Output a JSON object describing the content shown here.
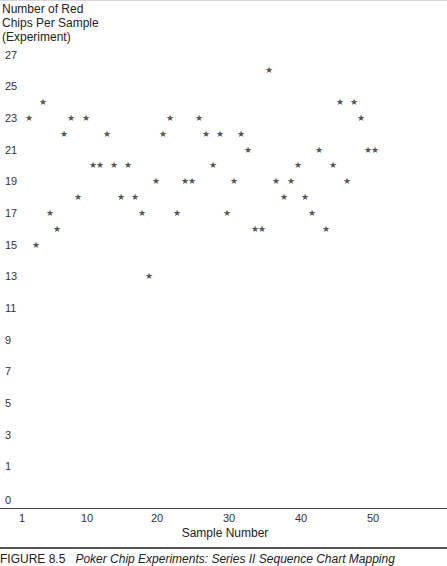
{
  "chart_data": {
    "type": "scatter",
    "title": "",
    "ylabel": "Number of Red Chips Per Sample (Experiment)",
    "ylabel_lines": [
      "Number of Red",
      "Chips Per Sample",
      "(Experiment)"
    ],
    "xlabel": "Sample Number",
    "x_ticks": [
      "1",
      "10",
      "20",
      "30",
      "40",
      "50"
    ],
    "y_ticks": [
      "27",
      "25",
      "23",
      "21",
      "19",
      "17",
      "15",
      "13",
      "11",
      "9",
      "7",
      "5",
      "3",
      "1",
      "0"
    ],
    "ylim": [
      0,
      27
    ],
    "xlim": [
      1,
      50
    ],
    "grid": false,
    "marker": "star",
    "x": [
      1,
      2,
      3,
      4,
      5,
      6,
      7,
      8,
      9,
      10,
      11,
      12,
      13,
      14,
      15,
      16,
      17,
      18,
      19,
      20,
      21,
      22,
      23,
      24,
      25,
      26,
      27,
      28,
      29,
      30,
      31,
      32,
      33,
      34,
      35,
      36,
      37,
      38,
      39,
      40,
      41,
      42,
      43,
      44,
      45,
      46,
      47,
      48,
      49,
      50
    ],
    "values": [
      23,
      15,
      24,
      17,
      16,
      22,
      23,
      18,
      23,
      20,
      20,
      22,
      20,
      18,
      20,
      18,
      17,
      13,
      19,
      22,
      23,
      17,
      19,
      19,
      23,
      22,
      20,
      22,
      17,
      19,
      22,
      21,
      16,
      16,
      26,
      19,
      18,
      19,
      20,
      18,
      17,
      21,
      16,
      20,
      24,
      19,
      24,
      23,
      21,
      21
    ]
  },
  "caption": {
    "prefix": "FIGURE 8.5",
    "italic": "Poker Chip Experiments: Series II Sequence Chart Mapping"
  },
  "marker_glyph": "★"
}
